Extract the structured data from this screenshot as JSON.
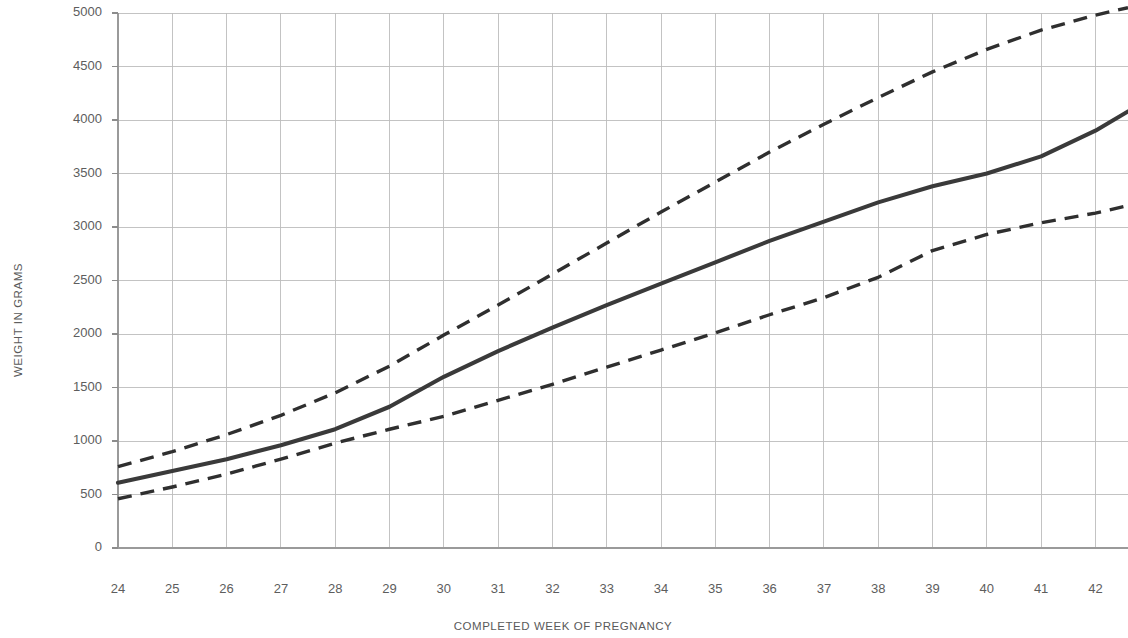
{
  "chart_data": {
    "type": "line",
    "title": "",
    "xlabel": "COMPLETED WEEK OF PREGNANCY",
    "ylabel": "WEIGHT IN GRAMS",
    "xlim": [
      24,
      42.6
    ],
    "ylim": [
      0,
      5000
    ],
    "grid": true,
    "legend_position": "none",
    "x": [
      24,
      25,
      26,
      27,
      28,
      29,
      30,
      31,
      32,
      33,
      34,
      35,
      36,
      37,
      38,
      39,
      40,
      41,
      42,
      42.6
    ],
    "xtick_labels": [
      "24",
      "25",
      "26",
      "27",
      "28",
      "29",
      "30",
      "31",
      "32",
      "33",
      "34",
      "35",
      "36",
      "37",
      "38",
      "39",
      "40",
      "41",
      "42"
    ],
    "ytick_labels": [
      "0",
      "500",
      "1000",
      "1500",
      "2000",
      "2500",
      "3000",
      "3500",
      "4000",
      "4500",
      "5000"
    ],
    "ytick_values": [
      0,
      500,
      1000,
      1500,
      2000,
      2500,
      3000,
      3500,
      4000,
      4500,
      5000
    ],
    "series": [
      {
        "name": "upper percentile",
        "style": "dashed",
        "color": "#2f2f2f",
        "values": [
          760,
          900,
          1060,
          1240,
          1450,
          1700,
          1990,
          2270,
          2560,
          2850,
          3140,
          3420,
          3700,
          3960,
          4210,
          4450,
          4660,
          4840,
          4980,
          5050
        ]
      },
      {
        "name": "median",
        "style": "solid",
        "color": "#3a3a3a",
        "values": [
          610,
          720,
          830,
          960,
          1110,
          1320,
          1600,
          1840,
          2060,
          2270,
          2470,
          2670,
          2870,
          3050,
          3230,
          3380,
          3500,
          3660,
          3900,
          4080
        ]
      },
      {
        "name": "lower percentile",
        "style": "dashed",
        "color": "#2f2f2f",
        "values": [
          460,
          570,
          690,
          830,
          980,
          1110,
          1230,
          1380,
          1530,
          1690,
          1850,
          2010,
          2180,
          2340,
          2530,
          2780,
          2930,
          3040,
          3130,
          3200
        ]
      }
    ]
  },
  "axes": {
    "y_axis_title": "WEIGHT IN GRAMS",
    "x_axis_title": "COMPLETED WEEK OF PREGNANCY"
  }
}
